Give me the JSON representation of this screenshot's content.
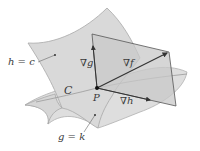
{
  "diagram": {
    "colors": {
      "surface_fill": "#dcdcdc",
      "surface_edge": "#a8a8a8",
      "plane_fill": "#cfcfcf",
      "line": "#444444",
      "text": "#3a3a3a"
    },
    "labels": {
      "surface_h": "h = c",
      "surface_g": "g = k",
      "curve": "C",
      "point": "P",
      "grad_g": "∇g",
      "grad_f": "∇f",
      "grad_h": "∇h"
    }
  }
}
